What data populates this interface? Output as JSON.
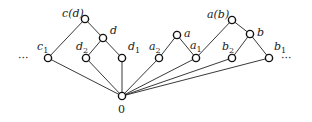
{
  "diagram": {
    "type": "lattice",
    "nodes": [
      {
        "id": "cd",
        "label": "c(d)",
        "sub": "",
        "x": 85,
        "y": 19,
        "lx": 62,
        "ly": 17
      },
      {
        "id": "d",
        "label": "d",
        "sub": "",
        "x": 103,
        "y": 38,
        "lx": 110,
        "ly": 34
      },
      {
        "id": "c1",
        "label": "c",
        "sub": "1",
        "x": 48,
        "y": 58,
        "lx": 37,
        "ly": 50
      },
      {
        "id": "d2",
        "label": "d",
        "sub": "2",
        "x": 86,
        "y": 58,
        "lx": 76,
        "ly": 50
      },
      {
        "id": "d1",
        "label": "d",
        "sub": "1",
        "x": 122,
        "y": 58,
        "lx": 128,
        "ly": 50
      },
      {
        "id": "a2",
        "label": "a",
        "sub": "2",
        "x": 159,
        "y": 58,
        "lx": 149,
        "ly": 50
      },
      {
        "id": "a",
        "label": "a",
        "sub": "",
        "x": 177,
        "y": 35,
        "lx": 184,
        "ly": 37
      },
      {
        "id": "a1",
        "label": "a",
        "sub": "1",
        "x": 196,
        "y": 58,
        "lx": 190,
        "ly": 49
      },
      {
        "id": "ab",
        "label": "a(b)",
        "sub": "",
        "x": 232,
        "y": 20,
        "lx": 207,
        "ly": 18
      },
      {
        "id": "b",
        "label": "b",
        "sub": "",
        "x": 250,
        "y": 34,
        "lx": 257,
        "ly": 36
      },
      {
        "id": "b2",
        "label": "b",
        "sub": "2",
        "x": 232,
        "y": 58,
        "lx": 222,
        "ly": 50
      },
      {
        "id": "b1",
        "label": "b",
        "sub": "1",
        "x": 269,
        "y": 58,
        "lx": 274,
        "ly": 50
      },
      {
        "id": "zero",
        "label": "0",
        "sub": "",
        "x": 122,
        "y": 96,
        "lx": 118,
        "ly": 113
      }
    ],
    "edges": [
      [
        "cd",
        "c1"
      ],
      [
        "cd",
        "d"
      ],
      [
        "d",
        "d2"
      ],
      [
        "d",
        "d1"
      ],
      [
        "a",
        "a2"
      ],
      [
        "a",
        "a1"
      ],
      [
        "ab",
        "a1"
      ],
      [
        "ab",
        "b"
      ],
      [
        "b",
        "b2"
      ],
      [
        "b",
        "b1"
      ],
      [
        "c1",
        "zero"
      ],
      [
        "d2",
        "zero"
      ],
      [
        "d1",
        "zero"
      ],
      [
        "a2",
        "zero"
      ],
      [
        "a1",
        "zero"
      ],
      [
        "b2",
        "zero"
      ],
      [
        "b1",
        "zero"
      ]
    ],
    "ellipsis_left": "···",
    "ellipsis_right": "···"
  }
}
